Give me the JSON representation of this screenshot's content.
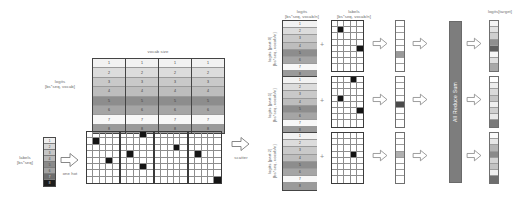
{
  "diagram": {
    "caption": ""
  },
  "left": {
    "logits_label": "logits\n[bs*seq, vocab]",
    "logits_label_line1": "logits",
    "logits_label_line2": "[bs*seq, vocab]",
    "vocab_size_label": "vocab size",
    "labels_label_line1": "labels",
    "labels_label_line2": "[bs*seq]",
    "one_hot_label": "one hot",
    "scatter_label": "scatter",
    "logits_rows": [
      1,
      2,
      3,
      4,
      5,
      6,
      7,
      8
    ],
    "logits_row_shades": [
      "#f2f2f2",
      "#dcdcdc",
      "#c9c9c9",
      "#bdbdbd",
      "#8d8d8d",
      "#a5a5a5",
      "#f7f7f7",
      "#9a9a9a"
    ],
    "logits_col_groups": 4,
    "labels_strip_values": [
      1,
      2,
      3,
      4,
      5,
      6,
      7,
      8
    ],
    "labels_strip_shades": [
      "#efefef",
      "#d8d8d8",
      "#c6c6c6",
      "#b9b9b9",
      "#8a8a8a",
      "#a2a2a2",
      "#6d6d6d",
      "#1d1d1d"
    ],
    "one_hot_rows": 8,
    "one_hot_cols_per_group": 5,
    "one_hot_groups": 4,
    "one_hot_active": [
      {
        "row": 1,
        "group": 0,
        "col": 1
      },
      {
        "row": 0,
        "group": 1,
        "col": 3
      },
      {
        "row": 4,
        "group": 0,
        "col": 3
      },
      {
        "row": 3,
        "group": 1,
        "col": 1
      },
      {
        "row": 5,
        "group": 1,
        "col": 3
      },
      {
        "row": 2,
        "group": 2,
        "col": 3
      },
      {
        "row": 3,
        "group": 3,
        "col": 1
      },
      {
        "row": 7,
        "group": 3,
        "col": 4
      }
    ]
  },
  "middle": {
    "logits_header_line1": "logits",
    "logits_header_line2": "[bs*seq, vocab/n]",
    "labels_header_line1": "labels",
    "labels_header_line2": "[bs*seq, vocab/n]",
    "plus_symbol": "+",
    "ranks": [
      {
        "rot_label_line1": "logits [part:0]",
        "rot_label_line2": "[bs*seq, vocab/n]",
        "logits_rows": [
          1,
          2,
          3,
          4,
          5,
          6,
          7,
          8
        ],
        "logits_shades": [
          "#f2f2f2",
          "#dcdcdc",
          "#c9c9c9",
          "#bdbdbd",
          "#8d8d8d",
          "#a5a5a5",
          "#f7f7f7",
          "#9a9a9a"
        ],
        "label_grid_active": [
          {
            "row": 1,
            "col": 1
          },
          {
            "row": 4,
            "col": 4
          }
        ],
        "mid_strip_shades": [
          "#ffffff",
          "#ffffff",
          "#ffffff",
          "#ffffff",
          "#ffffff",
          "#9a9a9a",
          "#ffffff",
          "#ffffff"
        ],
        "out_strip_shades": [
          "#f4f4f4",
          "#e2e2e2",
          "#cfcfcf",
          "#8f8f8f",
          "#5f5f5f",
          "#f7f7f7",
          "#dfdfdf",
          "#a8a8a8"
        ]
      },
      {
        "rot_label_line1": "logits [part:1]",
        "rot_label_line2": "[bs*seq, vocab/n]",
        "logits_rows": [
          1,
          2,
          3,
          4,
          5,
          6,
          7,
          8
        ],
        "logits_shades": [
          "#f2f2f2",
          "#dcdcdc",
          "#c9c9c9",
          "#bdbdbd",
          "#8d8d8d",
          "#a5a5a5",
          "#f7f7f7",
          "#9a9a9a"
        ],
        "label_grid_active": [
          {
            "row": 0,
            "col": 3
          },
          {
            "row": 3,
            "col": 1
          },
          {
            "row": 5,
            "col": 4
          }
        ],
        "mid_strip_shades": [
          "#ffffff",
          "#ffffff",
          "#ffffff",
          "#ffffff",
          "#4a4a4a",
          "#ffffff",
          "#ffffff",
          "#ffffff"
        ],
        "out_strip_shades": [
          "#ffffff",
          "#ededed",
          "#dadada",
          "#c4c4c4",
          "#efefef",
          "#cfcfcf",
          "#e8e8e8",
          "#7a7a7a"
        ]
      },
      {
        "rot_label_line1": "logits [part:2]",
        "rot_label_line2": "[bs*seq, vocab/n]",
        "logits_rows": [
          1,
          2,
          3,
          4,
          5,
          6,
          7,
          8
        ],
        "logits_shades": [
          "#f2f2f2",
          "#dcdcdc",
          "#c9c9c9",
          "#bdbdbd",
          "#8d8d8d",
          "#a5a5a5",
          "#f7f7f7",
          "#9a9a9a"
        ],
        "label_grid_active": [
          {
            "row": 3,
            "col": 3
          }
        ],
        "mid_strip_shades": [
          "#ffffff",
          "#ffffff",
          "#ffffff",
          "#b0b0b0",
          "#ffffff",
          "#ffffff",
          "#ffffff",
          "#ffffff"
        ],
        "out_strip_shades": [
          "#fafafa",
          "#e6e6e6",
          "#b4b4b4",
          "#8a8a8a",
          "#d3d3d3",
          "#c2c2c2",
          "#efefef",
          "#6e6e6e"
        ]
      }
    ]
  },
  "right": {
    "all_reduce_label": "All Reduce Sum",
    "output_label": "logits[target]"
  },
  "colors": {
    "all_reduce_bar": "#7d7d7d",
    "arrow_stroke": "#777777",
    "grid_line": "#8d8d8d",
    "active_cell": "#141414",
    "text": "#6b6b6b"
  }
}
